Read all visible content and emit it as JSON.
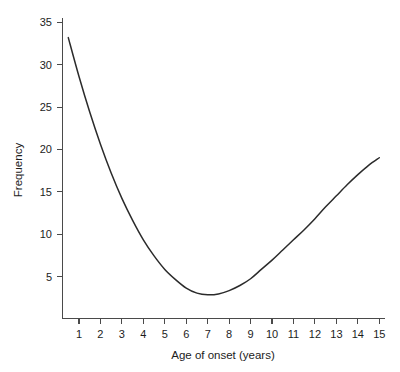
{
  "chart_data": {
    "type": "line",
    "title": "",
    "subtitle": "",
    "xlabel": "Age of onset (years)",
    "ylabel": "Frequency",
    "xlim": [
      0.5,
      15
    ],
    "ylim": [
      0,
      35
    ],
    "xticks": [
      1,
      2,
      3,
      4,
      5,
      6,
      7,
      8,
      9,
      10,
      11,
      12,
      13,
      14,
      15
    ],
    "xtick_labels": [
      "1",
      "2",
      "3",
      "4",
      "5",
      "6",
      "7",
      "8",
      "9",
      "10",
      "11",
      "12",
      "13",
      "14",
      "15"
    ],
    "yticks": [
      5,
      10,
      15,
      20,
      25,
      30,
      35
    ],
    "ytick_labels": [
      "5",
      "10",
      "15",
      "20",
      "25",
      "30",
      "35"
    ],
    "grid": false,
    "legend": false,
    "legend_position": "none",
    "line_color": "#2b2b2b",
    "axis_color": "#4a4a4a",
    "background_color": "#ffffff",
    "series": [
      {
        "name": "Frequency of onset",
        "x": [
          0.5,
          1.0,
          1.5,
          2.0,
          2.5,
          3.0,
          3.5,
          4.0,
          4.5,
          5.0,
          5.5,
          6.0,
          6.5,
          7.0,
          7.5,
          8.0,
          8.5,
          9.0,
          9.5,
          10.0,
          10.5,
          11.0,
          11.5,
          12.0,
          12.5,
          13.0,
          13.5,
          14.0,
          14.5,
          15.0
        ],
        "y": [
          33.2,
          28.6,
          24.4,
          20.6,
          17.2,
          14.2,
          11.6,
          9.3,
          7.4,
          5.8,
          4.6,
          3.6,
          3.0,
          2.8,
          2.9,
          3.3,
          3.9,
          4.7,
          5.8,
          6.9,
          8.1,
          9.3,
          10.5,
          11.8,
          13.2,
          14.5,
          15.8,
          17.0,
          18.1,
          19.0
        ]
      }
    ],
    "annotations": []
  },
  "axes": {
    "y_title": "Frequency",
    "x_title": "Age of onset (years)"
  }
}
